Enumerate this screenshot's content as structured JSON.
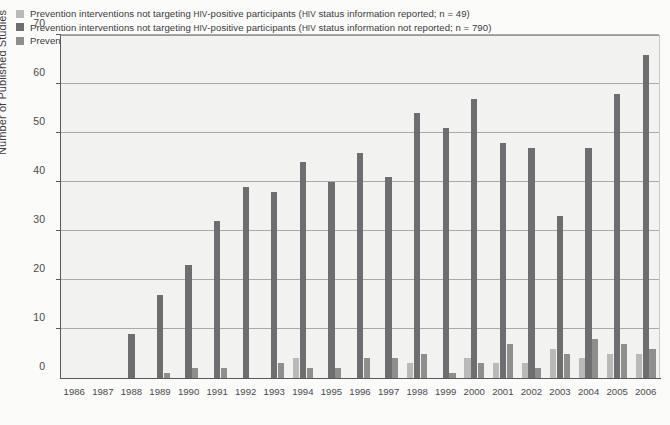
{
  "chart_data": {
    "type": "bar",
    "title": "",
    "xlabel": "",
    "ylabel": "Number of Published Studies",
    "ylim": [
      0,
      70
    ],
    "yticks": [
      0,
      10,
      20,
      30,
      40,
      50,
      60,
      70
    ],
    "grid": true,
    "legend_position": "top-left",
    "categories": [
      "1986",
      "1987",
      "1988",
      "1989",
      "1990",
      "1991",
      "1992",
      "1993",
      "1994",
      "1995",
      "1996",
      "1997",
      "1998",
      "1999",
      "2000",
      "2001",
      "2002",
      "2003",
      "2004",
      "2005",
      "2006"
    ],
    "series": [
      {
        "name": "Prevention interventions not targeting HIV-positive participants (HIV status information reported; n = 49)",
        "short_name": "not-targeting-status-reported",
        "color": "#b9b9b7",
        "n": 49,
        "values": [
          0,
          0,
          0,
          0,
          0,
          0,
          0,
          0,
          4,
          0,
          0,
          0,
          3,
          0,
          4,
          3,
          3,
          6,
          4,
          5,
          5
        ]
      },
      {
        "name": "Prevention interventions not targeting HIV-positive participants (HIV status information not reported; n = 790)",
        "short_name": "not-targeting-status-not-reported",
        "color": "#6e6e70",
        "n": 790,
        "values": [
          0,
          0,
          9,
          17,
          23,
          32,
          39,
          38,
          44,
          40,
          46,
          41,
          54,
          51,
          57,
          48,
          47,
          33,
          47,
          58,
          66
        ]
      },
      {
        "name": "Prevention interventions targeting HIV-positive participants (HIV status information reported; n = 59)",
        "short_name": "targeting-status-reported",
        "color": "#8e8e8c",
        "n": 59,
        "values": [
          0,
          0,
          0,
          1,
          2,
          2,
          0,
          3,
          2,
          2,
          4,
          4,
          5,
          1,
          3,
          7,
          2,
          5,
          8,
          7,
          6
        ]
      }
    ]
  },
  "legend": {
    "items": [
      {
        "prefix": "Prevention interventions not targeting ",
        "smallcaps": "HIV",
        "mid": "-positive participants (",
        "smallcaps2": "HIV",
        "suffix": " status information reported; n = 49)",
        "color": "#b9b9b7"
      },
      {
        "prefix": "Prevention interventions not targeting ",
        "smallcaps": "HIV",
        "mid": "-positive participants (",
        "smallcaps2": "HIV",
        "suffix": " status information not reported; n = 790)",
        "color": "#6e6e70"
      },
      {
        "prefix": "Prevention interventions targeting ",
        "smallcaps": "HIV",
        "mid": "-positive participants (",
        "smallcaps2": "HIV",
        "suffix": " status information reported; n = 59)",
        "color": "#8e8e8c"
      }
    ]
  },
  "axes": {
    "y_title": "Number of Published Studies",
    "y_tick_labels": [
      "0",
      "10",
      "20",
      "30",
      "40",
      "50",
      "60",
      "70"
    ],
    "x_tick_labels": [
      "1986",
      "1987",
      "1988",
      "1989",
      "1990",
      "1991",
      "1992",
      "1993",
      "1994",
      "1995",
      "1996",
      "1997",
      "1998",
      "1999",
      "2000",
      "2001",
      "2002",
      "2003",
      "2004",
      "2005",
      "2006"
    ]
  },
  "colors": {
    "series1": "#b9b9b7",
    "series2": "#6e6e70",
    "series3": "#8e8e8c",
    "plot_background": "#f2f2f0",
    "figure_background": "#fbfbfa",
    "axis": "#58585a",
    "gridline": "#a9a9a7"
  }
}
